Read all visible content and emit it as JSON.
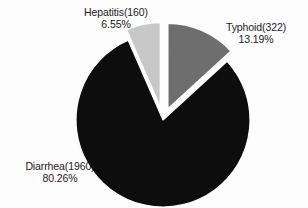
{
  "chart_data": {
    "type": "pie",
    "title": "",
    "subtitle": "",
    "xlabel": "",
    "ylabel": "",
    "legend_position": "none",
    "grid": false,
    "total": 2442,
    "categories": [
      "Diarrhea",
      "Typhoid",
      "Hepatitis"
    ],
    "values": [
      1960,
      322,
      160
    ],
    "percentages": [
      80.26,
      13.19,
      6.55
    ],
    "slices": [
      {
        "name": "Diarrhea",
        "count": 1960,
        "percent": 80.26,
        "label_name": "Diarrhea(1960)",
        "label_percent": "80.26%",
        "color": "#0d0d0d",
        "exploded": false,
        "start_angle": 47.5,
        "end_angle": 336.4
      },
      {
        "name": "Typhoid",
        "count": 322,
        "percent": 13.19,
        "label_name": "Typhoid(322)",
        "label_percent": "13.19%",
        "color": "#6e6e6e",
        "exploded": true,
        "start_angle": 0,
        "end_angle": 47.5
      },
      {
        "name": "Hepatitis",
        "count": 160,
        "percent": 6.55,
        "label_name": "Hepatitis(160)",
        "label_percent": "6.55%",
        "color": "#c8c8c8",
        "exploded": true,
        "start_angle": 336.4,
        "end_angle": 360
      }
    ],
    "geometry": {
      "center_x": 163,
      "center_y": 120,
      "radius": 87,
      "explode_offset": 11
    },
    "background_color": "#fdfdfd",
    "text_color": "#1b1b1b"
  }
}
